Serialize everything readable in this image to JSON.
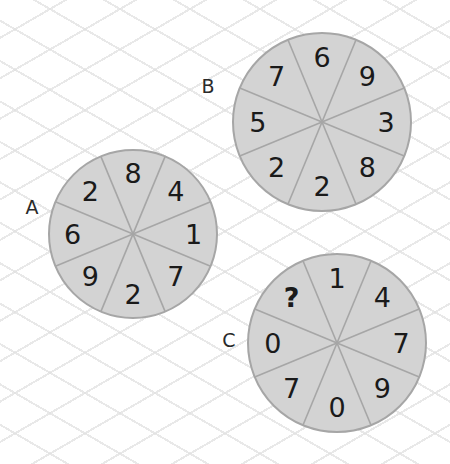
{
  "puzzle": {
    "type": "number-wheel-puzzle",
    "circles": [
      {
        "label": "A",
        "center": [
          133,
          234
        ],
        "radius": 84,
        "label_pos": [
          32,
          207
        ],
        "segments_clockwise_from_top": [
          "8",
          "4",
          "1",
          "7",
          "2",
          "9",
          "6",
          "2"
        ]
      },
      {
        "label": "B",
        "center": [
          322,
          122
        ],
        "radius": 89,
        "label_pos": [
          208,
          86
        ],
        "segments_clockwise_from_top": [
          "6",
          "9",
          "3",
          "8",
          "2",
          "2",
          "5",
          "7"
        ]
      },
      {
        "label": "C",
        "center": [
          337,
          343
        ],
        "radius": 89,
        "label_pos": [
          229,
          340
        ],
        "segments_clockwise_from_top": [
          "1",
          "4",
          "7",
          "9",
          "0",
          "7",
          "0",
          "?"
        ]
      }
    ],
    "unknown_marker": "?"
  },
  "colors": {
    "disc_fill": "#d3d3d3",
    "disc_stroke": "#a6a6a6",
    "text": "#1a1a1a",
    "background": "#ffffff",
    "grid_lines": "#e1e1e1"
  }
}
